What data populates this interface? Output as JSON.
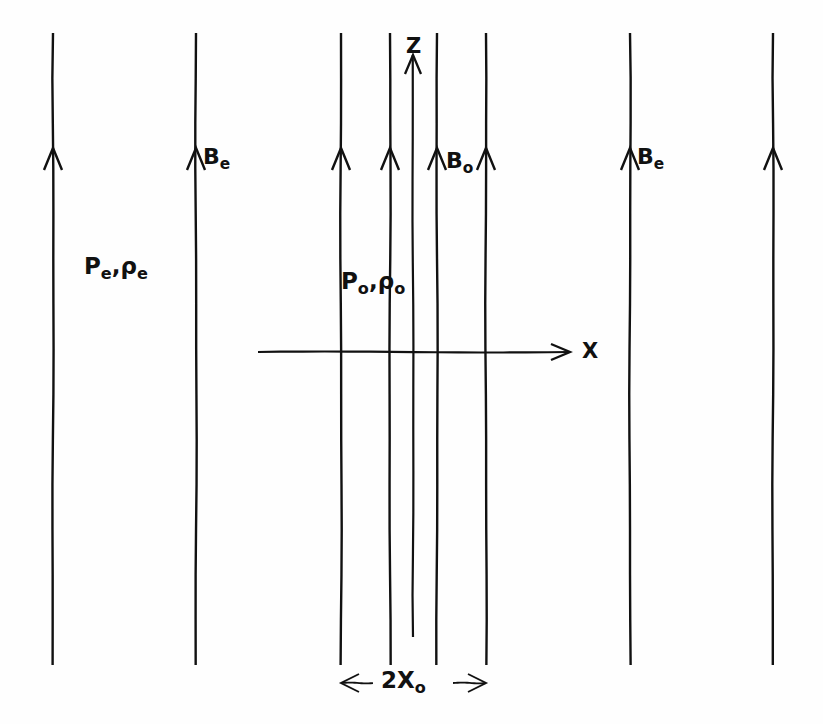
{
  "figure": {
    "background_color": "#fefefe",
    "ink_color": "#111111",
    "width": 823,
    "height": 724
  },
  "axes": {
    "z_axis": {
      "label": "Z",
      "direction": "up",
      "x": 413,
      "y_top": 55,
      "y_bottom": 637,
      "label_x": 406,
      "label_y": 36
    },
    "x_axis": {
      "label": "X",
      "direction": "right",
      "y": 352,
      "x_left": 258,
      "x_right": 570,
      "label_x": 582,
      "label_y": 341
    }
  },
  "field_lines": [
    {
      "name": "external-left-1",
      "x": 53,
      "region": "external",
      "arrow": true
    },
    {
      "name": "external-left-2",
      "x": 196,
      "region": "external",
      "arrow": true
    },
    {
      "name": "internal-1",
      "x": 341,
      "region": "internal",
      "arrow": true
    },
    {
      "name": "internal-2",
      "x": 390,
      "region": "internal",
      "arrow": true
    },
    {
      "name": "internal-3",
      "x": 437,
      "region": "internal",
      "arrow": true
    },
    {
      "name": "internal-4",
      "x": 486,
      "region": "internal",
      "arrow": true
    },
    {
      "name": "external-right-1",
      "x": 630,
      "region": "external",
      "arrow": true
    },
    {
      "name": "external-right-2",
      "x": 773,
      "region": "external",
      "arrow": true
    }
  ],
  "field_line_geometry": {
    "y_top": 33,
    "y_bottom": 665,
    "arrow_tip_y": 148,
    "arrow_half_width": 9,
    "arrow_height": 22
  },
  "labels": {
    "field_external_left": {
      "base": "B",
      "sub": "e",
      "x": 203,
      "y": 146
    },
    "field_internal": {
      "base": "B",
      "sub": "o",
      "x": 446,
      "y": 150
    },
    "field_external_right": {
      "base": "B",
      "sub": "e",
      "x": 637,
      "y": 146
    },
    "state_external": {
      "p_base": "P",
      "p_sub": "e",
      "separator": ",",
      "rho_base": "ρ",
      "rho_sub": "e",
      "x": 84,
      "y": 255
    },
    "state_internal": {
      "p_base": "P",
      "p_sub": "o",
      "separator": ",",
      "rho_base": "ρ",
      "rho_sub": "o",
      "x": 341,
      "y": 270
    }
  },
  "dimension": {
    "label_base": "2X",
    "label_sub": "o",
    "y": 683,
    "x_left": 341,
    "x_right": 486,
    "label_x": 381,
    "label_y": 669,
    "arrow_size": 9
  },
  "regions": {
    "internal_name": "slab interior",
    "external_name": "external medium"
  }
}
